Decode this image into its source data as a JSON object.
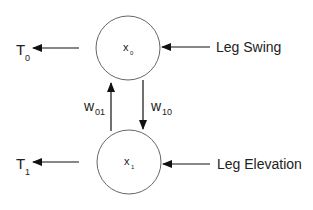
{
  "nodes": [
    {
      "id": "x0",
      "label": "x",
      "sub": "0"
    },
    {
      "id": "x1",
      "label": "x",
      "sub": "1"
    }
  ],
  "outputs": [
    {
      "label": "T",
      "sub": "0"
    },
    {
      "label": "T",
      "sub": "1"
    }
  ],
  "inputs": [
    {
      "label": "Leg Swing"
    },
    {
      "label": "Leg Elevation"
    }
  ],
  "weights": [
    {
      "label": "w",
      "sub": "01"
    },
    {
      "label": "w",
      "sub": "10"
    }
  ],
  "colors": {
    "stroke": "#222222",
    "circle": "#555555",
    "background": "#ffffff"
  }
}
